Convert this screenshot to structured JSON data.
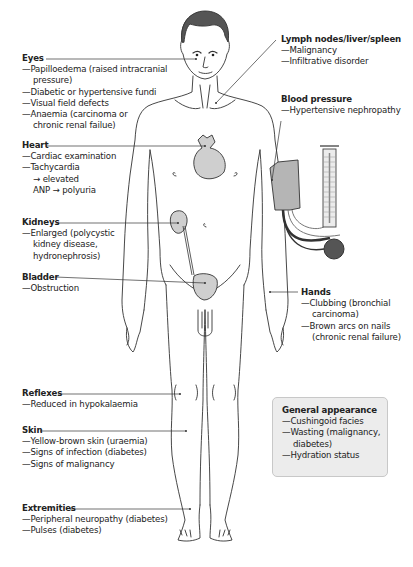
{
  "diagram": {
    "colors": {
      "organ_fill": "#cfcfcf",
      "hair_fill": "#555555",
      "outline": "#333333",
      "box_fill": "#ececec",
      "cuff_fill": "#b5b5b5"
    },
    "labels": {
      "eyes": {
        "title": "Eyes",
        "items": [
          {
            "line1": "—Papilloedema (raised intracranial",
            "line2": "pressure)"
          },
          {
            "line1": "—Diabetic or hypertensive fundi"
          },
          {
            "line1": "—Visual field defects"
          },
          {
            "line1": "—Anaemia (carcinoma or",
            "line2": "chronic renal failue)"
          }
        ]
      },
      "heart": {
        "title": "Heart",
        "items": [
          {
            "line1": "—Cardiac examination"
          },
          {
            "line1": "—Tachycardia",
            "line2": "→ elevated",
            "line3": "ANP → polyuria"
          }
        ]
      },
      "kidneys": {
        "title": "Kidneys",
        "items": [
          {
            "line1": "—Enlarged (polycystic",
            "line2": "kidney disease,",
            "line3": "hydronephrosis)"
          }
        ]
      },
      "bladder": {
        "title": "Bladder",
        "items": [
          {
            "line1": "—Obstruction"
          }
        ]
      },
      "reflexes": {
        "title": "Reflexes",
        "items": [
          {
            "line1": "—Reduced in hypokalaemia"
          }
        ]
      },
      "skin": {
        "title": "Skin",
        "items": [
          {
            "line1": "—Yellow-brown skin (uraemia)"
          },
          {
            "line1": "—Signs of infection (diabetes)"
          },
          {
            "line1": "—Signs of malignancy"
          }
        ]
      },
      "extremities": {
        "title": "Extremities",
        "items": [
          {
            "line1": "—Peripheral neuropathy (diabetes)"
          },
          {
            "line1": "—Pulses (diabetes)"
          }
        ]
      },
      "lymph": {
        "title": "Lymph nodes/liver/spleen",
        "items": [
          {
            "line1": "—Malignancy"
          },
          {
            "line1": "—Infiltrative disorder"
          }
        ]
      },
      "blood_pressure": {
        "title": "Blood pressure",
        "items": [
          {
            "line1": "—Hypertensive nephropathy"
          }
        ]
      },
      "hands": {
        "title": "Hands",
        "items": [
          {
            "line1": "—Clubbing (bronchial",
            "line2": "carcinoma)"
          },
          {
            "line1": "—Brown arcs on nails",
            "line2": "(chronic renal failure)"
          }
        ]
      },
      "general_appearance": {
        "title": "General appearance",
        "items": [
          {
            "line1": "—Cushingoid facies"
          },
          {
            "line1": "—Wasting (malignancy,",
            "line2": "diabetes)"
          },
          {
            "line1": "—Hydration status"
          }
        ]
      }
    }
  }
}
